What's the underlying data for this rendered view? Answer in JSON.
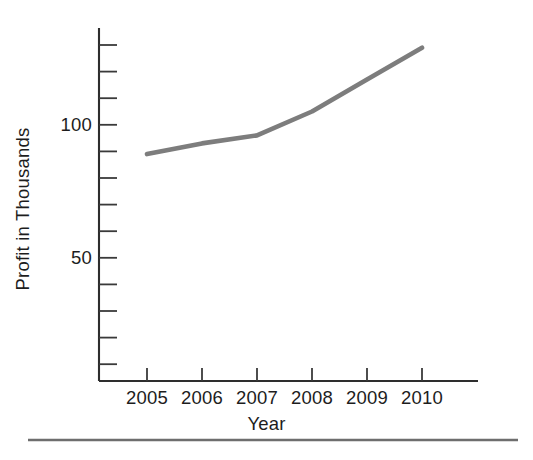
{
  "chart_data": {
    "type": "line",
    "title": "",
    "subtitle": "",
    "xlabel": "Year",
    "ylabel": "Profit in Thousands",
    "categories": [
      "2005",
      "2006",
      "2007",
      "2008",
      "2009",
      "2010"
    ],
    "x": [
      2005,
      2006,
      2007,
      2008,
      2009,
      2010
    ],
    "values": [
      89,
      93,
      96,
      105,
      117,
      129
    ],
    "series": [
      {
        "name": "Profit",
        "color": "#7d7d7d",
        "values": [
          89,
          93,
          96,
          105,
          117,
          129
        ]
      }
    ],
    "xlim": [
      2004.55,
      2010.55
    ],
    "ylim": [
      0,
      135
    ],
    "y_tick_values": [
      10,
      20,
      30,
      40,
      50,
      60,
      70,
      80,
      90,
      100,
      110,
      120,
      130
    ],
    "y_labeled_ticks": [
      {
        "value": 50,
        "label": "50"
      },
      {
        "value": 100,
        "label": "100"
      }
    ],
    "x_tick_labels": [
      "2005",
      "2006",
      "2007",
      "2008",
      "2009",
      "2010"
    ],
    "grid": false,
    "legend": false,
    "legend_position": "none",
    "axis_color": "#2e2e2e",
    "text_color": "#1d1d1d",
    "background": "#ffffff"
  },
  "figure": {
    "footer_rule_color": "#6e6e6e",
    "y_axis_label": "Profit in Thousands",
    "x_axis_label": "Year"
  }
}
